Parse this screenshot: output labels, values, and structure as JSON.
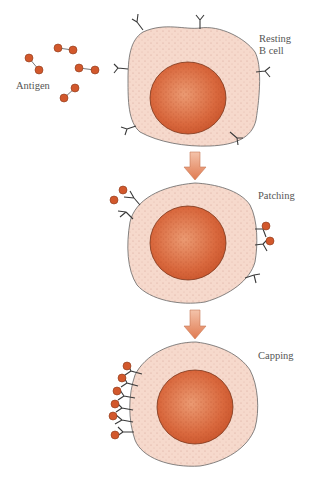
{
  "labels": {
    "antigen": "Antigen",
    "resting_line1": "Resting",
    "resting_line2": "B cell",
    "patching": "Patching",
    "capping": "Capping"
  },
  "stages": [
    {
      "name": "resting-b-cell",
      "label": "Resting B cell"
    },
    {
      "name": "patching",
      "label": "Patching"
    },
    {
      "name": "capping",
      "label": "Capping"
    }
  ],
  "colors": {
    "cytoplasm": "#f6d9cc",
    "nucleus": "#d8643a",
    "nucleus_light": "#e8906a",
    "antigen": "#d2582c",
    "outline": "#555555",
    "arrow": "#e8926c",
    "receptor": "#3a3a3a"
  }
}
